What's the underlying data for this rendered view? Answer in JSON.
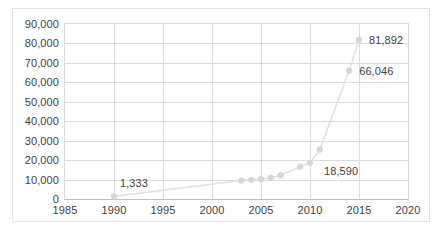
{
  "chart_data": {
    "type": "scatter",
    "title": "",
    "xlabel": "",
    "ylabel": "",
    "xlim": [
      1985,
      2020
    ],
    "ylim": [
      0,
      90000
    ],
    "grid": true,
    "legend": false,
    "x_ticks": [
      "1985",
      "1990",
      "1995",
      "2000",
      "2005",
      "2010",
      "2015",
      "2020"
    ],
    "x_tick_values": [
      1985,
      1990,
      1995,
      2000,
      2005,
      2010,
      2015,
      2020
    ],
    "y_ticks": [
      "0",
      "10,000",
      "20,000",
      "30,000",
      "40,000",
      "50,000",
      "60,000",
      "70,000",
      "80,000",
      "90,000"
    ],
    "y_tick_values": [
      0,
      10000,
      20000,
      30000,
      40000,
      50000,
      60000,
      70000,
      80000,
      90000
    ],
    "series": [
      {
        "name": "",
        "marker_color": "#d6d6d6",
        "line_color": "#e2e2e2",
        "x": [
          1990,
          2003,
          2004,
          2005,
          2006,
          2007,
          2009,
          2010,
          2011,
          2014,
          2015
        ],
        "y": [
          1333,
          9500,
          9900,
          10200,
          10900,
          12200,
          16600,
          18590,
          25400,
          66046,
          81892
        ]
      }
    ],
    "point_labels": [
      {
        "text": "1,333",
        "x": 1990,
        "y": 1333,
        "dx": 6,
        "dy": -13
      },
      {
        "text": "18,590",
        "x": 2010,
        "y": 18590,
        "dx": 14,
        "dy": 8
      },
      {
        "text": "66,046",
        "x": 2014,
        "y": 66046,
        "dx": 10,
        "dy": 0
      },
      {
        "text": "81,892",
        "x": 2015,
        "y": 81892,
        "dx": 10,
        "dy": 0
      }
    ]
  }
}
